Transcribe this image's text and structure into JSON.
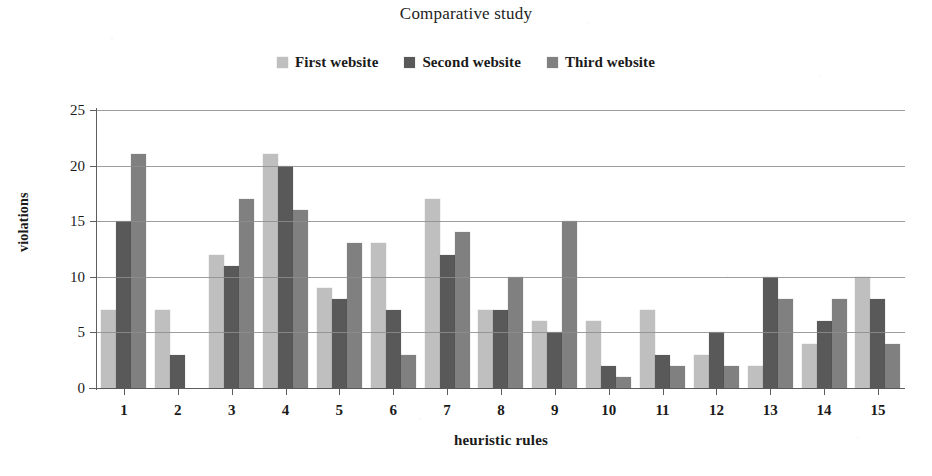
{
  "chart_data": {
    "type": "bar",
    "title": "Comparative study",
    "xlabel": "heuristic rules",
    "ylabel": "violations",
    "ylim": [
      0,
      25
    ],
    "yticks": [
      0,
      5,
      10,
      15,
      20,
      25
    ],
    "grid": true,
    "legend_position": "top-center",
    "categories": [
      "1",
      "2",
      "3",
      "4",
      "5",
      "6",
      "7",
      "8",
      "9",
      "10",
      "11",
      "12",
      "13",
      "14",
      "15"
    ],
    "series": [
      {
        "name": "First website",
        "color": "#bfbfbf",
        "values": [
          7,
          7,
          12,
          21,
          9,
          13,
          17,
          7,
          6,
          6,
          7,
          3,
          2,
          4,
          10
        ]
      },
      {
        "name": "Second website",
        "color": "#595959",
        "values": [
          15,
          3,
          11,
          20,
          8,
          7,
          12,
          7,
          5,
          2,
          3,
          5,
          10,
          6,
          8
        ]
      },
      {
        "name": "Third website",
        "color": "#808080",
        "values": [
          21,
          0,
          17,
          16,
          13,
          3,
          14,
          10,
          15,
          1,
          2,
          2,
          8,
          8,
          4
        ]
      }
    ]
  }
}
